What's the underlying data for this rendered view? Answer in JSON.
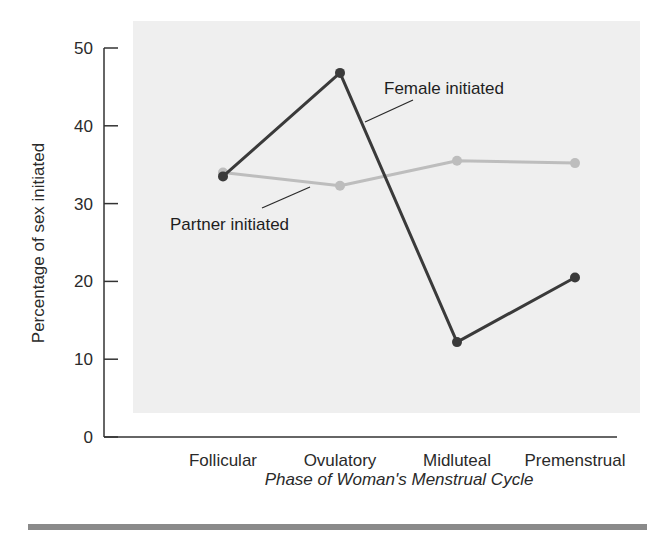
{
  "chart_data": {
    "type": "line",
    "title": "",
    "xlabel": "Phase of Woman's Menstrual Cycle",
    "ylabel": "Percentage of sex initiated",
    "categories": [
      "Follicular",
      "Ovulatory",
      "Midluteal",
      "Premenstrual"
    ],
    "series": [
      {
        "name": "Female initiated",
        "values": [
          33.5,
          46.8,
          12.2,
          20.5
        ],
        "color": "#3a3a3a"
      },
      {
        "name": "Partner initiated",
        "values": [
          34.0,
          32.3,
          35.5,
          35.2
        ],
        "color": "#bdbdbd"
      }
    ],
    "yticks": [
      0,
      10,
      20,
      30,
      40,
      50
    ],
    "ylim": [
      0,
      50
    ],
    "grid": false,
    "legend": "inline annotations with leader lines",
    "annotations": [
      {
        "text": "Female initiated",
        "series": "Female initiated"
      },
      {
        "text": "Partner initiated",
        "series": "Partner initiated"
      }
    ],
    "background_color": "#eeeeee",
    "footer_rule_color": "#8a8a8a"
  }
}
